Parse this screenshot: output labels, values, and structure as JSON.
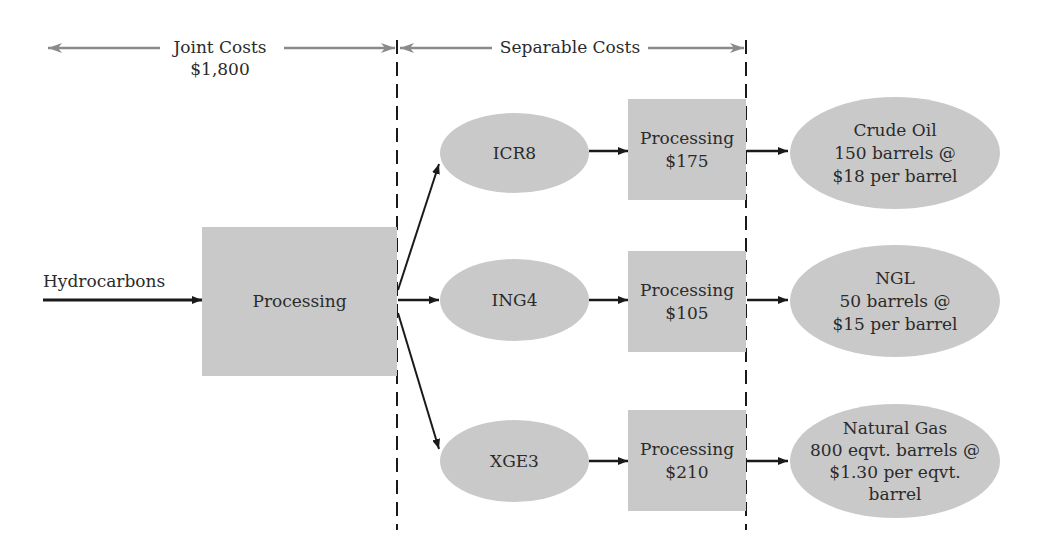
{
  "header": {
    "joint_costs": {
      "label": "Joint Costs",
      "amount": "$1,800"
    },
    "separable_costs": {
      "label": "Separable Costs"
    }
  },
  "input": {
    "label": "Hydrocarbons"
  },
  "joint_process": {
    "label": "Processing"
  },
  "split_off_products": [
    {
      "name": "ICR8"
    },
    {
      "name": "ING4"
    },
    {
      "name": "XGE3"
    }
  ],
  "separable_processes": [
    {
      "label": "Processing",
      "cost": "$175"
    },
    {
      "label": "Processing",
      "cost": "$105"
    },
    {
      "label": "Processing",
      "cost": "$210"
    }
  ],
  "final_products": [
    {
      "name": "Crude Oil",
      "line2": "150 barrels @",
      "line3": "$18 per barrel",
      "line4": ""
    },
    {
      "name": "NGL",
      "line2": "50 barrels @",
      "line3": "$15 per barrel",
      "line4": ""
    },
    {
      "name": "Natural Gas",
      "line2": "800 eqvt. barrels @",
      "line3": "$1.30 per eqvt.",
      "line4": "barrel"
    }
  ],
  "colors": {
    "node_fill": "#c9c9c9",
    "range_arrow": "#8a8a8a",
    "flow_arrow": "#1a1a1a",
    "divider": "#1a1a1a"
  }
}
